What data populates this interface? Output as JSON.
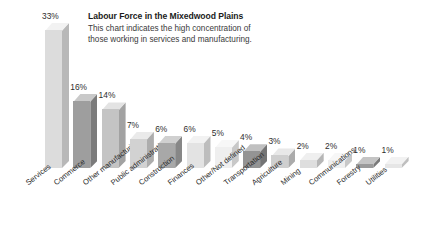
{
  "title": "Labour Force in the Mixedwood Plains",
  "subtitle_line1": "This chart indicates the high concentration of",
  "subtitle_line2": "those working in services and manufacturing.",
  "background": "#ffffff",
  "chart_data": {
    "type": "bar",
    "title": "Labour Force in the Mixedwood Plains",
    "subtitle": "This chart indicates the high concentration of those working in services and manufacturing.",
    "xlabel": "",
    "ylabel": "",
    "ylim": [
      0,
      33
    ],
    "grid": false,
    "legend": "none",
    "unit": "%",
    "categories": [
      "Services",
      "Commerce",
      "Other manufacturing",
      "Public administration",
      "Construction",
      "Finances",
      "Other/Not defined",
      "Transportation",
      "Agriculture",
      "Mining",
      "Communications",
      "Forestry",
      "Utilities"
    ],
    "values": [
      33,
      16,
      14,
      7,
      6,
      6,
      5,
      4,
      3,
      2,
      2,
      1,
      1
    ],
    "value_labels": [
      "33%",
      "16%",
      "14%",
      "7%",
      "6%",
      "6%",
      "5%",
      "4%",
      "3%",
      "2%",
      "2%",
      "1%",
      "1%"
    ],
    "bar_colors": [
      "#dcdcdc",
      "#9e9e9e",
      "#c4c4c4",
      "#d2d2d2",
      "#a8a8a8",
      "#e3e3e3",
      "#efefef",
      "#949494",
      "#cfcfcf",
      "#dedede",
      "#efefef",
      "#9a9a9a",
      "#e6e6e6"
    ],
    "side_colors": [
      "#b8b8b8",
      "#7b7b7b",
      "#a2a2a2",
      "#adadad",
      "#878787",
      "#bdbdbd",
      "#c8c8c8",
      "#747474",
      "#ababab",
      "#b6b6b6",
      "#c8c8c8",
      "#7a7a7a",
      "#bfbfbf"
    ],
    "top_colors": [
      "#f2f2f2",
      "#c9c9c9",
      "#e3e3e3",
      "#eaeaea",
      "#d0d0d0",
      "#f2f2f2",
      "#f7f7f7",
      "#c0c0c0",
      "#e8e8e8",
      "#efefef",
      "#f7f7f7",
      "#c4c4c4",
      "#f2f2f2"
    ]
  }
}
